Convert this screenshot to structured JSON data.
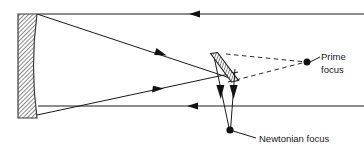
{
  "diagram": {
    "type": "optical-ray-diagram",
    "canvas": {
      "width": 364,
      "height": 158
    },
    "colors": {
      "stroke": "#1a1a1a",
      "hatch": "#555555",
      "background": "#ffffff",
      "dashed": "#2a2a2a"
    },
    "labels": {
      "prime_focus_line1": "Prime",
      "prime_focus_line2": "focus",
      "newtonian_focus": "Newtonian focus"
    },
    "components": {
      "primary_mirror": {
        "name": "primary-mirror",
        "x": 18,
        "y": 14,
        "width": 19,
        "height": 104,
        "description": "concave hatched primary mirror at left"
      },
      "diagonal_mirror": {
        "name": "diagonal-mirror",
        "x1": 211,
        "y1": 55,
        "x2": 236,
        "y2": 83,
        "description": "tilted hatched flat secondary mirror"
      },
      "prime_focus_point": {
        "cx": 307,
        "cy": 62,
        "r": 3.4
      },
      "newtonian_focus_point": {
        "cx": 230,
        "cy": 130,
        "r": 3.4
      }
    },
    "rays": {
      "incoming_top": {
        "from_x": 364,
        "to_x": 37,
        "y": 14,
        "arrow_x": 192
      },
      "incoming_bottom": {
        "from_x": 364,
        "to_x": 37,
        "y": 106,
        "arrow_x": 189
      },
      "reflected_top": {
        "x1": 37,
        "y1": 14,
        "x2": 232,
        "y2": 79,
        "arrow_x": 168,
        "arrow_y": 58
      },
      "reflected_bottom": {
        "x1": 37,
        "y1": 114,
        "x2": 236,
        "y2": 72,
        "arrow_x": 168,
        "arrow_y": 87
      },
      "to_newtonian_left": {
        "x1": 216,
        "y1": 62,
        "x2": 230,
        "y2": 130,
        "arrow_y": 97
      },
      "to_newtonian_right": {
        "x1": 233,
        "y1": 66,
        "x2": 230,
        "y2": 130,
        "arrow_y": 97
      },
      "dashed_to_prime_upper": {
        "x1": 228,
        "y1": 55,
        "x2": 307,
        "y2": 62
      },
      "dashed_to_prime_lower": {
        "x1": 224,
        "y1": 80,
        "x2": 307,
        "y2": 62
      }
    },
    "leaders": {
      "prime_focus_leader": {
        "x1": 311,
        "y1": 62,
        "x2": 320,
        "y2": 58
      },
      "newtonian_focus_leader": {
        "x1": 233,
        "y1": 131,
        "x2": 255,
        "y2": 137
      }
    },
    "text_positions": {
      "prime_line1": {
        "x": 322,
        "y": 61
      },
      "prime_line2": {
        "x": 322,
        "y": 74
      },
      "newtonian": {
        "x": 258,
        "y": 141
      }
    }
  }
}
